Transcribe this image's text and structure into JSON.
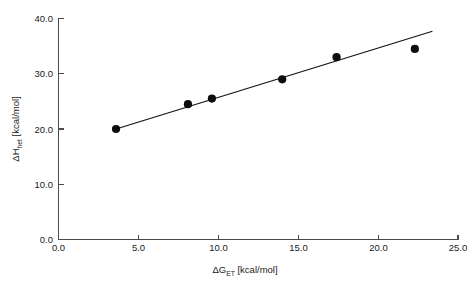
{
  "chart_data": {
    "type": "scatter",
    "title": "",
    "subtitle": "",
    "xlabel": "ΔG_ET [kcal/mol]",
    "xlabel_main": "ΔG",
    "xlabel_sub": "ET",
    "xlabel_unit": " [kcal/mol]",
    "ylabel": "ΔH_het [kcal/mol]",
    "ylabel_main": "ΔH",
    "ylabel_sub": "het",
    "ylabel_unit": " [kcal/mol]",
    "xlim": [
      0.0,
      25.0
    ],
    "ylim": [
      0.0,
      40.0
    ],
    "xticks": [
      0.0,
      5.0,
      10.0,
      15.0,
      20.0,
      25.0
    ],
    "yticks": [
      0.0,
      10.0,
      20.0,
      30.0,
      40.0
    ],
    "xticklabels": [
      "0.0",
      "5.0",
      "10.0",
      "15.0",
      "20.0",
      "25.0"
    ],
    "yticklabels": [
      "0.0",
      "10.0",
      "20.0",
      "30.0",
      "40.0"
    ],
    "grid": false,
    "legend": false,
    "legend_position": "none",
    "x": [
      3.6,
      8.1,
      9.6,
      14.0,
      17.4,
      22.3
    ],
    "y": [
      20.0,
      24.5,
      25.5,
      29.0,
      33.0,
      34.5
    ],
    "series": [
      {
        "name": "measured points",
        "marker": "filled-circle",
        "color": "#0d0d0d",
        "points": [
          {
            "x": 3.6,
            "y": 20.0
          },
          {
            "x": 8.1,
            "y": 24.5
          },
          {
            "x": 9.6,
            "y": 25.5
          },
          {
            "x": 14.0,
            "y": 29.0
          },
          {
            "x": 17.4,
            "y": 33.0
          },
          {
            "x": 22.3,
            "y": 34.5
          }
        ]
      }
    ],
    "fit_line": {
      "name": "linear fit",
      "color": "#111111",
      "x_start": 3.5,
      "y_start": 19.9,
      "x_end": 23.4,
      "y_end": 37.7
    },
    "annotations": [],
    "colors": {
      "marker": "#0d0d0d",
      "fit_line": "#111111",
      "axis": "#4a4a4a",
      "text": "#1a1a1a",
      "background": "#ffffff"
    }
  }
}
